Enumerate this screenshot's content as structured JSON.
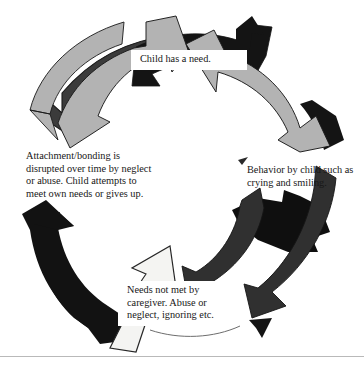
{
  "diagram": {
    "type": "cyclical-arrow-diagram",
    "direction": "clockwise",
    "steps": [
      {
        "id": "need",
        "order": 1,
        "position": "top",
        "label": "Child has a need.",
        "style": "white-box",
        "arrow_color": "#b3b3b3"
      },
      {
        "id": "behavior",
        "order": 2,
        "position": "right",
        "label": "Behavior by child such as crying and smiling.",
        "style": "plain",
        "arrow_color": "#b3b3b3"
      },
      {
        "id": "needs-not-met",
        "order": 3,
        "position": "bottom",
        "label": "Needs not met by caregiver. Abuse or neglect, ignoring etc.",
        "style": "white-box",
        "arrow_color": "#333333"
      },
      {
        "id": "attachment",
        "order": 4,
        "position": "left",
        "label": "Attachment/bonding is disrupted over time by neglect or abuse. Child attempts to meet own needs or gives up.",
        "style": "plain",
        "arrow_color": "#111111"
      }
    ],
    "colors": {
      "light_gray_arrow": "#b3b3b3",
      "mid_gray_arrow": "#333333",
      "dark_arrow": "#111111",
      "white_arrow": "#f4f4f2",
      "outline": "#1a1a1a",
      "background": "#ffffff",
      "rule": "#b9b9b9",
      "text": "#171717"
    }
  }
}
